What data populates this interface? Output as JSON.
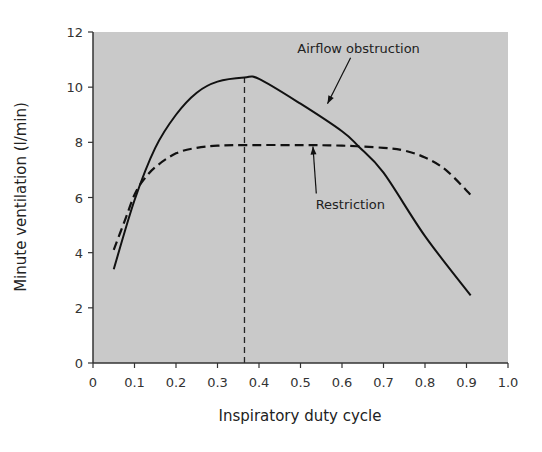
{
  "chart_data": {
    "type": "line",
    "title": "",
    "xlabel": "Inspiratory duty cycle",
    "ylabel": "Minute ventilation (l/min)",
    "xlim": [
      0,
      1.0
    ],
    "ylim": [
      0,
      12
    ],
    "xticks": [
      "0",
      "0.1",
      "0.2",
      "0.3",
      "0.4",
      "0.5",
      "0.6",
      "0.7",
      "0.8",
      "0.9",
      "1.0"
    ],
    "yticks": [
      "0",
      "2",
      "4",
      "6",
      "8",
      "10",
      "12"
    ],
    "grid": false,
    "background": "#c9c9c9",
    "series": [
      {
        "name": "Airflow obstruction",
        "style": "solid",
        "x": [
          0.05,
          0.1,
          0.15,
          0.2,
          0.25,
          0.3,
          0.365,
          0.4,
          0.5,
          0.6,
          0.64,
          0.7,
          0.8,
          0.91
        ],
        "y": [
          3.4,
          5.9,
          7.8,
          9.0,
          9.8,
          10.2,
          10.35,
          10.3,
          9.4,
          8.4,
          7.85,
          6.9,
          4.6,
          2.45
        ]
      },
      {
        "name": "Restriction",
        "style": "dashed",
        "x": [
          0.05,
          0.08,
          0.1,
          0.12,
          0.15,
          0.2,
          0.25,
          0.3,
          0.365,
          0.5,
          0.6,
          0.7,
          0.75,
          0.8,
          0.85,
          0.91
        ],
        "y": [
          4.1,
          5.3,
          6.1,
          6.6,
          7.1,
          7.6,
          7.8,
          7.88,
          7.9,
          7.9,
          7.88,
          7.8,
          7.7,
          7.45,
          7.0,
          6.1
        ]
      }
    ],
    "annotations": [
      {
        "text": "Airflow obstruction",
        "x": 0.64,
        "y": 11.25,
        "arrow_to": [
          0.565,
          9.4
        ]
      },
      {
        "text": "Restriction",
        "x": 0.62,
        "y": 5.6,
        "arrow_to": [
          0.53,
          7.85
        ]
      },
      {
        "text": "",
        "type": "vertical-dashed-line",
        "x": 0.365,
        "y_from": 0,
        "y_to": 10.35
      }
    ]
  }
}
